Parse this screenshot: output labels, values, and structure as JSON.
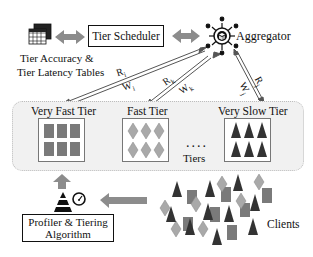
{
  "diagram": {
    "scheduler": {
      "label": "Tier Scheduler"
    },
    "tables": {
      "label_line1": "Tier Accuracy &",
      "label_line2": "Tier Latency Tables",
      "icon": "table-icon"
    },
    "aggregator": {
      "label": "Aggregator",
      "icon": "aggregator-hub-icon"
    },
    "tiers_region": {
      "label": "Tiers",
      "ellipsis": "...."
    },
    "tiers": [
      {
        "label": "Very Fast Tier",
        "shape": "square",
        "color": "#7a7a7a"
      },
      {
        "label": "Fast Tier",
        "shape": "diamond",
        "color": "#a9a9a9"
      },
      {
        "label": "Very Slow Tier",
        "shape": "triangle",
        "color": "#333333"
      }
    ],
    "edges": [
      {
        "from": "Aggregator",
        "to": "Very Fast Tier",
        "up": "Rᵢ",
        "down": "Wᵢ"
      },
      {
        "from": "Aggregator",
        "to": "Fast Tier",
        "up": "Rₖ",
        "down": "Wₖ"
      },
      {
        "from": "Aggregator",
        "to": "Very Slow Tier",
        "up": "Rⱼ",
        "down": "Wⱼ"
      }
    ],
    "labels": {
      "Ri": "R",
      "Ri_sub": "i",
      "Wi": "W",
      "Wi_sub": "i",
      "Rk": "R",
      "Rk_sub": "k",
      "Wk": "W",
      "Wk_sub": "k",
      "Rj": "R",
      "Rj_sub": "j",
      "Wj": "W",
      "Wj_sub": "j"
    },
    "profiler": {
      "label_line1": "Profiler & Tiering",
      "label_line2": "Algorithm",
      "icons": [
        "pyramid-icon",
        "gauge-icon"
      ]
    },
    "clients": {
      "label": "Clients"
    },
    "colors": {
      "arrow_gray": "#8c8c8c",
      "square": "#7a7a7a",
      "diamond": "#a9a9a9",
      "triangle": "#333333",
      "region_bg": "#f1f1f1"
    }
  }
}
